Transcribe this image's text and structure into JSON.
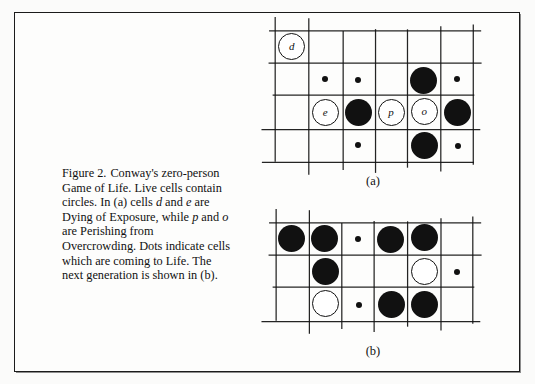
{
  "page": {
    "background_color": "#fdfdfc",
    "border_color": "#1b1b1b",
    "ink_color": "#111111"
  },
  "caption": {
    "figure_number": "Figure 2.",
    "line1": "Conway's",
    "full_text": "Figure 2.   Conway's zero-person Game of Life. Live cells contain circles. In (a) cells d and e are Dying of Exposure, while p and o are Perishing from Overcrowding. Dots indicate cells which are coming to Life. The next generation is shown in (b).",
    "segments": [
      {
        "text": "Figure 2.",
        "style": "roman"
      },
      {
        "text": "Conway's zero-person Game of Life. Live cells contain circles. In (a) cells ",
        "style": "roman"
      },
      {
        "text": "d",
        "style": "italic"
      },
      {
        "text": " and ",
        "style": "roman"
      },
      {
        "text": "e",
        "style": "italic"
      },
      {
        "text": " are Dying of Exposure, while ",
        "style": "roman"
      },
      {
        "text": "p",
        "style": "italic"
      },
      {
        "text": " and ",
        "style": "roman"
      },
      {
        "text": "o",
        "style": "italic"
      },
      {
        "text": " are Perishing from Overcrowding. Dots indicate cells which are coming to Life. The next generation is shown in (b).",
        "style": "roman"
      }
    ]
  },
  "figures": [
    {
      "id": "figure-a",
      "label": "(a)",
      "origin": {
        "x": 276,
        "y": 30
      },
      "cell_size": 33,
      "rows": 4,
      "cols": 6,
      "label_pos": {
        "x": 353,
        "y": 174
      },
      "cells": [
        {
          "row": 0,
          "col": 0,
          "type": "open",
          "label": "d",
          "size": 27
        },
        {
          "row": 1,
          "col": 1,
          "type": "dot",
          "size": 6
        },
        {
          "row": 1,
          "col": 2,
          "type": "dot",
          "size": 6
        },
        {
          "row": 1,
          "col": 4,
          "type": "filled",
          "size": 27
        },
        {
          "row": 1,
          "col": 5,
          "type": "dot",
          "size": 6
        },
        {
          "row": 2,
          "col": 1,
          "type": "open",
          "label": "e",
          "size": 27
        },
        {
          "row": 2,
          "col": 2,
          "type": "filled",
          "size": 27
        },
        {
          "row": 2,
          "col": 3,
          "type": "open",
          "label": "p",
          "size": 27
        },
        {
          "row": 2,
          "col": 4,
          "type": "open",
          "label": "o",
          "size": 27
        },
        {
          "row": 2,
          "col": 5,
          "type": "filled",
          "size": 27
        },
        {
          "row": 3,
          "col": 2,
          "type": "dot",
          "size": 6
        },
        {
          "row": 3,
          "col": 4,
          "type": "filled",
          "size": 27
        },
        {
          "row": 3,
          "col": 5,
          "type": "dot",
          "size": 6
        }
      ]
    },
    {
      "id": "figure-b",
      "label": "(b)",
      "origin": {
        "x": 276,
        "y": 222
      },
      "cell_size": 33,
      "rows": 3,
      "cols": 6,
      "label_pos": {
        "x": 353,
        "y": 344
      },
      "cells": [
        {
          "row": 0,
          "col": 0,
          "type": "filled",
          "size": 27
        },
        {
          "row": 0,
          "col": 1,
          "type": "filled",
          "size": 27
        },
        {
          "row": 0,
          "col": 2,
          "type": "dot",
          "size": 6
        },
        {
          "row": 0,
          "col": 3,
          "type": "filled",
          "size": 27
        },
        {
          "row": 0,
          "col": 4,
          "type": "filled",
          "size": 27
        },
        {
          "row": 1,
          "col": 1,
          "type": "filled",
          "size": 27
        },
        {
          "row": 1,
          "col": 4,
          "type": "open",
          "size": 27
        },
        {
          "row": 1,
          "col": 5,
          "type": "dot",
          "size": 6
        },
        {
          "row": 2,
          "col": 1,
          "type": "open",
          "size": 27
        },
        {
          "row": 2,
          "col": 2,
          "type": "dot",
          "size": 6
        },
        {
          "row": 2,
          "col": 3,
          "type": "filled",
          "size": 27
        },
        {
          "row": 2,
          "col": 4,
          "type": "filled",
          "size": 27
        }
      ]
    }
  ],
  "legend_semantics": {
    "filled_circle": "live cell",
    "open_circle": "live cell dying",
    "dot": "cell coming to life"
  }
}
